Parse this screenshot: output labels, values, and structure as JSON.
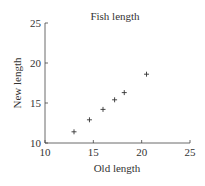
{
  "chart_data": {
    "type": "scatter",
    "title": "Fish length",
    "xlabel": "Old length",
    "ylabel": "New length",
    "xlim": [
      10,
      25
    ],
    "ylim": [
      10,
      25
    ],
    "xticks": [
      "10",
      "15",
      "20",
      "25"
    ],
    "yticks": [
      "10",
      "15",
      "20",
      "25"
    ],
    "grid": false,
    "marker": "+",
    "series": [
      {
        "name": "Fish",
        "x": [
          13.0,
          14.6,
          16.0,
          17.2,
          18.2,
          20.5
        ],
        "y": [
          11.4,
          12.9,
          14.2,
          15.4,
          16.3,
          18.6
        ]
      }
    ]
  }
}
